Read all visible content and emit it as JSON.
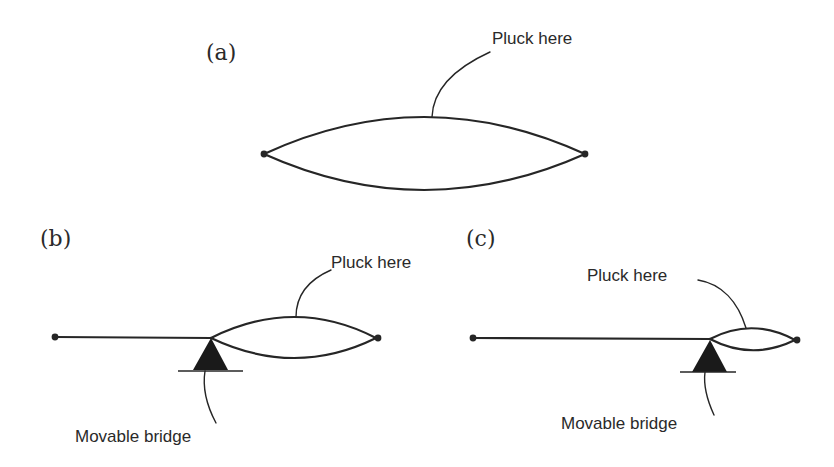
{
  "figure": {
    "colors": {
      "ink": "#262626",
      "background": "#ffffff"
    },
    "panels": [
      {
        "id": "a",
        "label": "(a)",
        "pluck_label": "Pluck here",
        "has_bridge": false
      },
      {
        "id": "b",
        "label": "(b)",
        "pluck_label": "Pluck here",
        "bridge_label": "Movable bridge",
        "has_bridge": true
      },
      {
        "id": "c",
        "label": "(c)",
        "pluck_label": "Pluck here",
        "bridge_label": "Movable bridge",
        "has_bridge": true
      }
    ]
  }
}
